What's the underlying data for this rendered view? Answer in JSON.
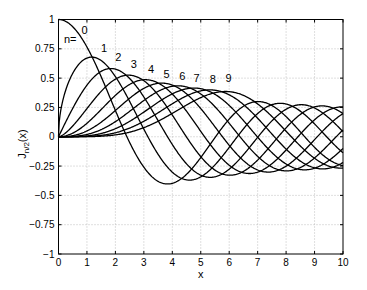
{
  "chart_data": {
    "type": "line",
    "title": "",
    "xlabel": "x",
    "ylabel": "J_{n/2}(x)",
    "xlim": [
      0,
      10
    ],
    "ylim": [
      -1,
      1
    ],
    "grid": true,
    "grid_style": "dotted",
    "legend": "none (inline curve labels)",
    "x_ticks": [
      "0",
      "1",
      "2",
      "3",
      "4",
      "5",
      "6",
      "7",
      "8",
      "9",
      "10"
    ],
    "y_ticks": [
      "-1",
      "-0.75",
      "-0.5",
      "-0.25",
      "0",
      "0.25",
      "0.5",
      "0.75",
      "1"
    ],
    "annotation_prefix": "n=",
    "series": [
      {
        "name": "n=0",
        "order": 0.0,
        "label": "0",
        "label_pos": [
          0.92,
          0.88
        ],
        "peak": {
          "x": 0.0,
          "y": 1.0
        }
      },
      {
        "name": "n=1",
        "order": 0.5,
        "label": "1",
        "label_pos": [
          1.6,
          0.725
        ],
        "peak": {
          "x": 1.17,
          "y": 0.673
        }
      },
      {
        "name": "n=2",
        "order": 1.0,
        "label": "2",
        "label_pos": [
          2.1,
          0.645
        ],
        "peak": {
          "x": 1.84,
          "y": 0.582
        }
      },
      {
        "name": "n=3",
        "order": 1.5,
        "label": "3",
        "label_pos": [
          2.65,
          0.585
        ],
        "peak": {
          "x": 2.46,
          "y": 0.528
        }
      },
      {
        "name": "n=4",
        "order": 2.0,
        "label": "4",
        "label_pos": [
          3.25,
          0.54
        ],
        "peak": {
          "x": 3.05,
          "y": 0.486
        }
      },
      {
        "name": "n=5",
        "order": 2.5,
        "label": "5",
        "label_pos": [
          3.8,
          0.505
        ],
        "peak": {
          "x": 3.63,
          "y": 0.453
        }
      },
      {
        "name": "n=6",
        "order": 3.0,
        "label": "6",
        "label_pos": [
          4.35,
          0.485
        ],
        "peak": {
          "x": 4.2,
          "y": 0.434
        }
      },
      {
        "name": "n=7",
        "order": 3.5,
        "label": "7",
        "label_pos": [
          4.85,
          0.468
        ],
        "peak": {
          "x": 4.77,
          "y": 0.414
        }
      },
      {
        "name": "n=8",
        "order": 4.0,
        "label": "8",
        "label_pos": [
          5.42,
          0.46
        ],
        "peak": {
          "x": 5.32,
          "y": 0.4
        }
      },
      {
        "name": "n=9",
        "order": 4.5,
        "label": "9",
        "label_pos": [
          5.98,
          0.468
        ],
        "peak": {
          "x": 5.88,
          "y": 0.386
        }
      }
    ],
    "line_color": "#000000",
    "grid_color": "#b0b0b0"
  },
  "axes": {
    "xlabel": "x",
    "ylabel_main": "J",
    "ylabel_sub": "n/2",
    "ylabel_arg": "(x)"
  }
}
